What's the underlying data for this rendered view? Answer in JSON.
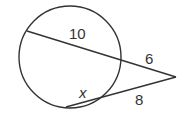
{
  "diagram": {
    "type": "intersecting-secants",
    "labels": {
      "outer_secant_internal": "10",
      "outer_secant_external": "6",
      "lower_secant_internal": "x",
      "lower_secant_external": "8"
    },
    "colors": {
      "stroke": "#333333",
      "text": "#333333",
      "background": "#ffffff"
    }
  }
}
